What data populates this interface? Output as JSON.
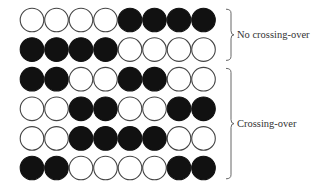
{
  "colors": {
    "filled": "#111111",
    "empty": "#ffffff",
    "stroke": "#444444",
    "brace": "#666666",
    "text": "#333333"
  },
  "grid": {
    "rows": [
      [
        0,
        0,
        0,
        0,
        1,
        1,
        1,
        1
      ],
      [
        1,
        1,
        1,
        1,
        0,
        0,
        0,
        0
      ],
      [
        1,
        1,
        0,
        0,
        1,
        1,
        0,
        0
      ],
      [
        0,
        0,
        1,
        1,
        0,
        0,
        1,
        1
      ],
      [
        0,
        0,
        1,
        1,
        1,
        1,
        0,
        0
      ],
      [
        1,
        1,
        0,
        0,
        0,
        0,
        1,
        1
      ]
    ]
  },
  "groups": [
    {
      "label": "No crossing-over",
      "row_start": 0,
      "row_end": 1
    },
    {
      "label": "Crossing-over",
      "row_start": 2,
      "row_end": 5
    }
  ]
}
